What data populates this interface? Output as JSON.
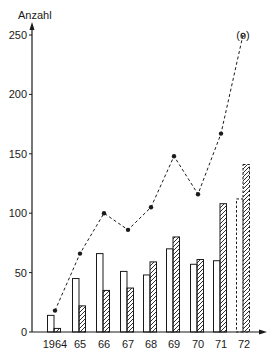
{
  "chart_data": {
    "type": "bar",
    "title": "",
    "ylabel": "Anzahl",
    "xlabel": "",
    "ylim": [
      0,
      250
    ],
    "yticks": [
      0,
      50,
      100,
      150,
      200,
      250
    ],
    "grid": false,
    "legend": null,
    "categories": [
      "1964",
      "65",
      "66",
      "67",
      "68",
      "69",
      "70",
      "71",
      "72"
    ],
    "series": [
      {
        "name": "empty-bars",
        "style": "outline",
        "values": [
          14,
          45,
          66,
          51,
          48,
          70,
          57,
          60,
          112
        ],
        "dashed_last": true
      },
      {
        "name": "hatched-bars",
        "style": "hatched",
        "values": [
          3,
          22,
          35,
          37,
          59,
          80,
          61,
          108,
          141
        ],
        "dashed_last": true
      },
      {
        "name": "dotted-line-total",
        "style": "dashed-line-with-dots",
        "values": [
          18,
          66,
          100,
          86,
          105,
          148,
          116,
          167,
          250
        ],
        "last_point_label": "(o)"
      }
    ],
    "annotations": [
      {
        "category": "72",
        "value": 250,
        "text": "(o)"
      }
    ]
  },
  "colors": {
    "ink": "#1a1a1a",
    "background": "#ffffff"
  }
}
